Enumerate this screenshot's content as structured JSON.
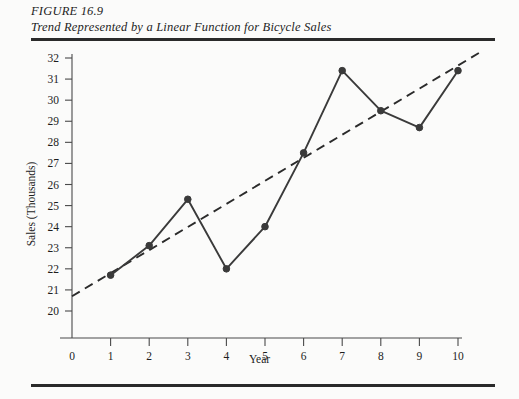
{
  "figure": {
    "id_label": "FIGURE 16.9",
    "caption": "Trend Represented by a Linear Function for Bicycle Sales"
  },
  "chart_data": {
    "type": "line",
    "title": "Trend Represented by a Linear Function for Bicycle Sales",
    "xlabel": "Year",
    "ylabel": "Sales (Thousands)",
    "xlim": [
      0,
      10
    ],
    "ylim": [
      20,
      32
    ],
    "x_ticks": [
      0,
      1,
      2,
      3,
      4,
      5,
      6,
      7,
      8,
      9,
      10
    ],
    "y_ticks": [
      20,
      21,
      22,
      23,
      24,
      25,
      26,
      27,
      28,
      29,
      30,
      31,
      32
    ],
    "grid": false,
    "legend": "none",
    "axis_break_note": "y-axis starts at 20 with origin labelled 0",
    "x": [
      1,
      2,
      3,
      4,
      5,
      6,
      7,
      8,
      9,
      10
    ],
    "series": [
      {
        "name": "Bicycle Sales",
        "style": "solid-with-markers",
        "color": "#3a3a3a",
        "values": [
          21.7,
          23.1,
          25.3,
          22.0,
          24.0,
          27.5,
          31.4,
          29.5,
          28.7,
          31.4
        ]
      },
      {
        "name": "Linear Trend",
        "style": "dashed",
        "color": "#2b2b2b",
        "x_endpoints": [
          0,
          10.6
        ],
        "y_endpoints": [
          20.7,
          32.3
        ]
      }
    ],
    "colors": {
      "data_line": "#3a3a3a",
      "trend_line": "#2b2b2b",
      "axis": "#4a4a4a",
      "rule": "#2a2a2a",
      "background": "#fbfbfa"
    }
  }
}
